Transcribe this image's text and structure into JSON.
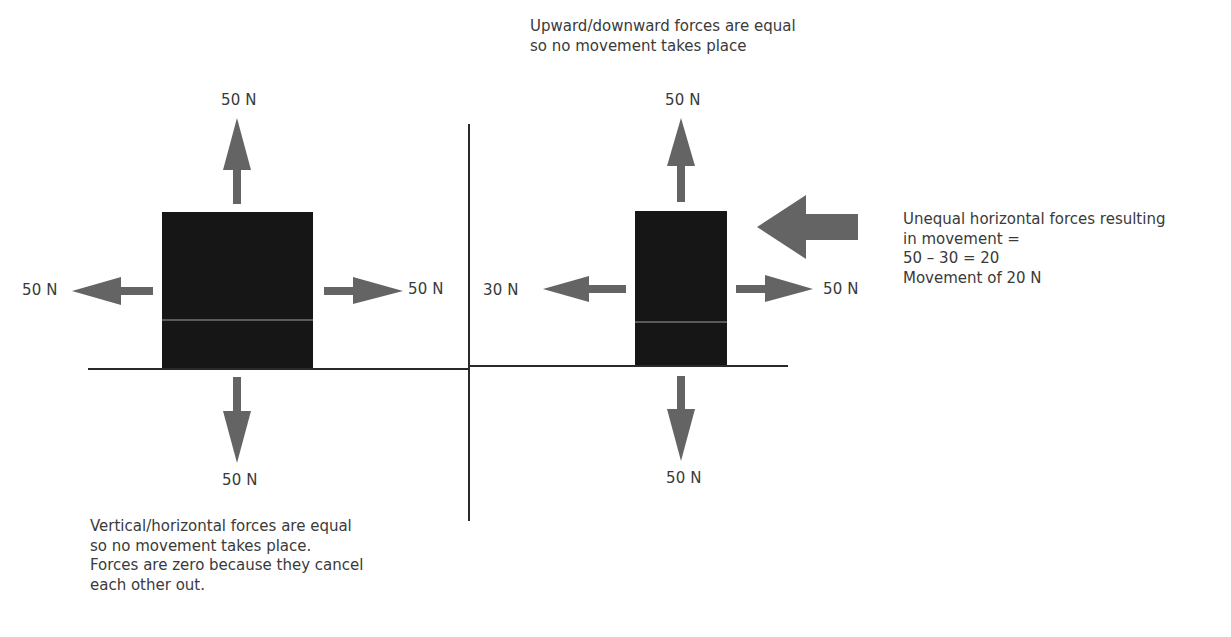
{
  "colors": {
    "arrow": "#646464",
    "block": "#161616",
    "block_stripe": "#5a5a5a",
    "line": "#2a2a2a",
    "text": "#3a3a3a"
  },
  "left_diagram": {
    "labels": {
      "up": "50 N",
      "down": "50 N",
      "left": "50 N",
      "right": "50 N"
    },
    "caption": [
      "Vertical/horizontal forces are equal",
      "so no movement takes place.",
      "Forces are zero because they cancel",
      "each other out."
    ]
  },
  "right_diagram": {
    "title": [
      "Upward/downward forces are equal",
      "so no movement takes place"
    ],
    "labels": {
      "up": "50 N",
      "down": "50 N",
      "left": "30 N",
      "right": "50 N"
    },
    "resultant_note": [
      "Unequal horizontal forces resulting",
      "in movement =",
      "50 – 30 = 20",
      "Movement of 20 N"
    ]
  },
  "icons": {
    "up_arrow": "arrow-up-icon",
    "down_arrow": "arrow-down-icon",
    "left_arrow": "arrow-left-icon",
    "right_arrow": "arrow-right-icon",
    "resultant_arrow": "resultant-arrow-left-icon"
  }
}
